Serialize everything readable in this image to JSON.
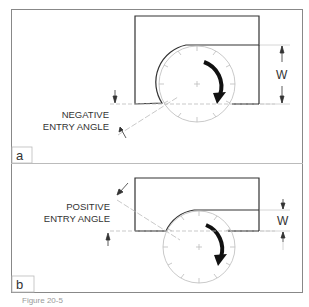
{
  "header": {
    "partial_text": "...pproach strategy..."
  },
  "panels": [
    {
      "id": "a",
      "label": "a",
      "angle_label_line1": "NEGATIVE",
      "angle_label_line2": "ENTRY ANGLE",
      "dimension_label": "W",
      "rotation": "clockwise"
    },
    {
      "id": "b",
      "label": "b",
      "angle_label_line1": "POSITIVE",
      "angle_label_line2": "ENTRY ANGLE",
      "dimension_label": "W",
      "rotation": "clockwise"
    }
  ],
  "caption": "Figure 20-5",
  "colors": {
    "outline": "#333333",
    "frame": "#888888",
    "faint": "#bbbbbb",
    "arrow": "#111111"
  }
}
